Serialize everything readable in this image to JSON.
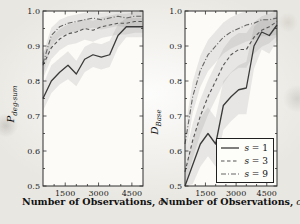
{
  "figure": {
    "background": "#e9e7e1"
  },
  "chart_data": [
    {
      "type": "line",
      "title": "",
      "xlabel": "Number of Observations,",
      "xlabel_var": "o",
      "ylabel_main": "P",
      "ylabel_sub": "deg-sum",
      "xlim": [
        500,
        5000
      ],
      "ylim": [
        0.5,
        1.0
      ],
      "xticks": [
        1500,
        3000,
        4500
      ],
      "yticks": [
        0.5,
        0.6,
        0.7,
        0.8,
        0.9,
        1.0
      ],
      "xminor_step": 500,
      "yminor_step": 0.05,
      "frame_color": "#2f2f2f",
      "plot_bg": "#fcfbf8",
      "band_color": "rgba(140,140,140,0.18)",
      "x": [
        500,
        875,
        1250,
        1625,
        2000,
        2375,
        2750,
        3125,
        3500,
        3875,
        4250,
        4625,
        5000
      ],
      "series": [
        {
          "label": "s = 1",
          "style": "solid",
          "color": "#3a3a3a",
          "width": 1.3,
          "values": [
            0.75,
            0.8,
            0.825,
            0.845,
            0.82,
            0.862,
            0.875,
            0.868,
            0.875,
            0.93,
            0.955,
            0.955,
            0.955
          ],
          "band_lower": [
            0.715,
            0.765,
            0.79,
            0.805,
            0.785,
            0.825,
            0.84,
            0.833,
            0.84,
            0.895,
            0.925,
            0.925,
            0.925
          ],
          "band_upper": [
            0.79,
            0.845,
            0.865,
            0.885,
            0.858,
            0.898,
            0.91,
            0.905,
            0.915,
            0.962,
            0.98,
            0.98,
            0.98
          ]
        },
        {
          "label": "s = 3",
          "style": "dashed",
          "color": "#555555",
          "width": 1.1,
          "values": [
            0.845,
            0.895,
            0.92,
            0.935,
            0.94,
            0.95,
            0.945,
            0.955,
            0.96,
            0.965,
            0.965,
            0.97,
            0.97
          ],
          "band_lower": [
            0.808,
            0.862,
            0.888,
            0.903,
            0.908,
            0.918,
            0.912,
            0.923,
            0.928,
            0.933,
            0.933,
            0.938,
            0.938
          ],
          "band_upper": [
            0.878,
            0.925,
            0.948,
            0.962,
            0.967,
            0.977,
            0.972,
            0.982,
            0.987,
            0.992,
            0.992,
            0.997,
            0.997
          ]
        },
        {
          "label": "s = 9",
          "style": "dashdot",
          "color": "#666666",
          "width": 1.1,
          "values": [
            0.85,
            0.93,
            0.955,
            0.965,
            0.97,
            0.975,
            0.98,
            0.975,
            0.98,
            0.985,
            0.98,
            0.985,
            0.985
          ],
          "band_lower": [
            0.818,
            0.9,
            0.927,
            0.937,
            0.942,
            0.947,
            0.952,
            0.947,
            0.952,
            0.957,
            0.952,
            0.957,
            0.957
          ],
          "band_upper": [
            0.878,
            0.952,
            0.975,
            0.985,
            0.99,
            0.995,
            0.998,
            0.995,
            0.998,
            1.0,
            0.998,
            1.0,
            1.0
          ]
        }
      ]
    },
    {
      "type": "line",
      "title": "",
      "xlabel": "Number of Observations,",
      "xlabel_var": "o",
      "ylabel_main": "D",
      "ylabel_sub": "Base",
      "xlim": [
        500,
        5000
      ],
      "ylim": [
        0.5,
        1.0
      ],
      "xticks": [
        1500,
        3000,
        4500
      ],
      "yticks": [
        0.5,
        0.6,
        0.7,
        0.8,
        0.9,
        1.0
      ],
      "xminor_step": 500,
      "yminor_step": 0.05,
      "frame_color": "#2f2f2f",
      "plot_bg": "#fcfbf8",
      "band_color": "rgba(140,140,140,0.18)",
      "legend_position": "bottom-right",
      "x": [
        500,
        875,
        1250,
        1625,
        2000,
        2375,
        2750,
        3125,
        3500,
        3875,
        4250,
        4625,
        5000
      ],
      "series": [
        {
          "label": "s = 1",
          "style": "solid",
          "color": "#3a3a3a",
          "width": 1.3,
          "values": [
            0.5,
            0.56,
            0.62,
            0.65,
            0.62,
            0.73,
            0.755,
            0.775,
            0.78,
            0.9,
            0.94,
            0.93,
            0.96
          ],
          "band_lower": [
            0.5,
            0.505,
            0.555,
            0.585,
            0.555,
            0.66,
            0.685,
            0.705,
            0.705,
            0.835,
            0.89,
            0.878,
            0.915
          ],
          "band_upper": [
            0.555,
            0.625,
            0.695,
            0.725,
            0.695,
            0.8,
            0.825,
            0.845,
            0.855,
            0.955,
            0.978,
            0.972,
            0.99
          ]
        },
        {
          "label": "s = 3",
          "style": "dashed",
          "color": "#555555",
          "width": 1.1,
          "values": [
            0.54,
            0.63,
            0.7,
            0.755,
            0.8,
            0.845,
            0.875,
            0.89,
            0.89,
            0.925,
            0.945,
            0.955,
            0.97
          ],
          "band_lower": [
            0.5,
            0.578,
            0.648,
            0.703,
            0.748,
            0.793,
            0.823,
            0.838,
            0.838,
            0.878,
            0.898,
            0.908,
            0.928
          ],
          "band_upper": [
            0.585,
            0.678,
            0.748,
            0.803,
            0.848,
            0.893,
            0.922,
            0.937,
            0.937,
            0.968,
            0.985,
            0.992,
            1.0
          ]
        },
        {
          "label": "s = 9",
          "style": "dashdot",
          "color": "#666666",
          "width": 1.1,
          "values": [
            0.62,
            0.755,
            0.83,
            0.875,
            0.9,
            0.925,
            0.94,
            0.95,
            0.96,
            0.965,
            0.975,
            0.975,
            0.98
          ],
          "band_lower": [
            0.573,
            0.708,
            0.783,
            0.828,
            0.853,
            0.878,
            0.893,
            0.903,
            0.913,
            0.918,
            0.928,
            0.928,
            0.933
          ],
          "band_upper": [
            0.662,
            0.798,
            0.872,
            0.917,
            0.942,
            0.967,
            0.982,
            0.992,
            1.0,
            1.0,
            1.0,
            1.0,
            1.0
          ]
        }
      ]
    }
  ]
}
